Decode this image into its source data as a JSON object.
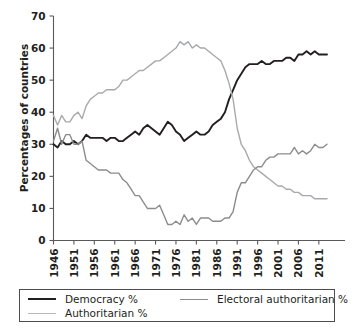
{
  "chart_data": {
    "type": "line",
    "title": "",
    "xlabel": "",
    "ylabel": "Percentages of countries",
    "ylim": [
      0,
      70
    ],
    "xlim": [
      1946,
      2013
    ],
    "ytick_values": [
      0,
      10,
      20,
      30,
      40,
      50,
      60,
      70
    ],
    "xtick_values": [
      1946,
      1951,
      1956,
      1961,
      1966,
      1971,
      1976,
      1981,
      1986,
      1991,
      1996,
      2001,
      2006,
      2011
    ],
    "grid": false,
    "legend_position": "below",
    "x": [
      1946,
      1947,
      1948,
      1949,
      1950,
      1951,
      1952,
      1953,
      1954,
      1955,
      1956,
      1957,
      1958,
      1959,
      1960,
      1961,
      1962,
      1963,
      1964,
      1965,
      1966,
      1967,
      1968,
      1969,
      1970,
      1971,
      1972,
      1973,
      1974,
      1975,
      1976,
      1977,
      1978,
      1979,
      1980,
      1981,
      1982,
      1983,
      1984,
      1985,
      1986,
      1987,
      1988,
      1989,
      1990,
      1991,
      1992,
      1993,
      1994,
      1995,
      1996,
      1997,
      1998,
      1999,
      2000,
      2001,
      2002,
      2003,
      2004,
      2005,
      2006,
      2007,
      2008,
      2009,
      2010,
      2011,
      2012,
      2013
    ],
    "series": [
      {
        "name": "Democracy %",
        "color": "#231f20",
        "width": 1.9,
        "values": [
          30,
          29,
          31,
          30,
          30,
          31,
          30,
          31,
          33,
          32,
          32,
          32,
          32,
          31,
          32,
          32,
          31,
          31,
          32,
          33,
          34,
          33,
          35,
          36,
          35,
          34,
          33,
          35,
          37,
          36,
          34,
          33,
          31,
          32,
          33,
          34,
          33,
          33,
          34,
          36,
          37,
          38,
          40,
          44,
          47,
          50,
          52,
          54,
          55,
          55,
          55,
          56,
          55,
          55,
          56,
          56,
          56,
          57,
          57,
          56,
          58,
          58,
          59,
          58,
          59,
          58,
          58,
          58
        ]
      },
      {
        "name": "Authoritarian %",
        "color": "#a7a9ac",
        "width": 1.4,
        "values": [
          39,
          36,
          39,
          37,
          37,
          39,
          40,
          38,
          42,
          44,
          45,
          46,
          46,
          47,
          47,
          47,
          48,
          50,
          50,
          51,
          52,
          53,
          53,
          54,
          55,
          56,
          56,
          57,
          58,
          59,
          60,
          62,
          61,
          62,
          60,
          61,
          60,
          60,
          59,
          58,
          57,
          56,
          53,
          49,
          44,
          35,
          30,
          28,
          25,
          23,
          22,
          21,
          20,
          19,
          18,
          17,
          17,
          16,
          16,
          15,
          15,
          14,
          14,
          14,
          13,
          13,
          13,
          13
        ]
      },
      {
        "name": "Electoral authoritarian %",
        "color": "#8c8c8e",
        "width": 1.4,
        "values": [
          31,
          35,
          30,
          33,
          33,
          30,
          30,
          31,
          25,
          24,
          23,
          22,
          22,
          22,
          21,
          21,
          21,
          19,
          18,
          16,
          14,
          14,
          12,
          10,
          10,
          10,
          11,
          8,
          5,
          5,
          6,
          5,
          8,
          6,
          7,
          5,
          7,
          7,
          7,
          6,
          6,
          6,
          7,
          7,
          9,
          15,
          18,
          18,
          20,
          22,
          23,
          23,
          25,
          26,
          26,
          27,
          27,
          27,
          27,
          29,
          27,
          28,
          27,
          28,
          30,
          29,
          29,
          30
        ]
      }
    ]
  },
  "legend": {
    "items": [
      {
        "label": "Democracy %",
        "color": "#231f20",
        "width": 2.2
      },
      {
        "label": "Authoritarian %",
        "color": "#b6b8ba",
        "width": 1.5
      },
      {
        "label": "Electoral authoritarian %",
        "color": "#8c8c8e",
        "width": 1.5
      }
    ]
  }
}
